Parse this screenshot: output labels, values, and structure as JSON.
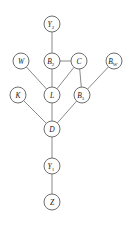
{
  "diagram": {
    "type": "directed-acyclic-graph",
    "style": {
      "background": "#ffffff",
      "node_fill": "#ffffff",
      "node_stroke": "#6e6e6e",
      "edge_stroke": "#8a8a8a",
      "label_color": "#1a1a1a",
      "node_radius": 8
    },
    "nodes": [
      {
        "id": "Y2",
        "base": "Y",
        "sub": "2",
        "label": "Y2",
        "x": 52,
        "y": 24
      },
      {
        "id": "W",
        "base": "W",
        "sub": "",
        "label": "W",
        "x": 21,
        "y": 61
      },
      {
        "id": "B2",
        "base": "B",
        "sub": "2",
        "label": "B2",
        "x": 52,
        "y": 61
      },
      {
        "id": "C",
        "base": "C",
        "sub": "",
        "label": "C",
        "x": 79,
        "y": 61
      },
      {
        "id": "BW",
        "base": "B",
        "sub": "W",
        "label": "BW",
        "x": 114,
        "y": 61
      },
      {
        "id": "K",
        "base": "K",
        "sub": "",
        "label": "K",
        "x": 18,
        "y": 95
      },
      {
        "id": "L",
        "base": "L",
        "sub": "",
        "label": "L",
        "x": 52,
        "y": 95
      },
      {
        "id": "B3",
        "base": "B",
        "sub": "3",
        "label": "B3",
        "x": 82,
        "y": 95
      },
      {
        "id": "D",
        "base": "D",
        "sub": "",
        "label": "D",
        "x": 52,
        "y": 129
      },
      {
        "id": "Y1",
        "base": "Y",
        "sub": "1",
        "label": "Y1",
        "x": 52,
        "y": 166
      },
      {
        "id": "Z",
        "base": "Z",
        "sub": "",
        "label": "Z",
        "x": 52,
        "y": 202
      }
    ],
    "edges": [
      {
        "from": "Y2",
        "to": "B2"
      },
      {
        "from": "B2",
        "to": "C"
      },
      {
        "from": "B2",
        "to": "L"
      },
      {
        "from": "W",
        "to": "L"
      },
      {
        "from": "C",
        "to": "L"
      },
      {
        "from": "C",
        "to": "B3"
      },
      {
        "from": "BW",
        "to": "B3"
      },
      {
        "from": "K",
        "to": "D"
      },
      {
        "from": "L",
        "to": "D"
      },
      {
        "from": "B3",
        "to": "D"
      },
      {
        "from": "D",
        "to": "Y1"
      },
      {
        "from": "Y1",
        "to": "Z"
      }
    ]
  }
}
